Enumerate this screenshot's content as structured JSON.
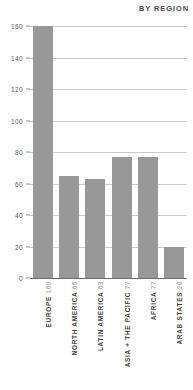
{
  "chart": {
    "title": "BY REGION"
  },
  "chart_data": {
    "type": "bar",
    "title": "BY REGION",
    "xlabel": "",
    "ylabel": "",
    "ylim": [
      0,
      160
    ],
    "yticks": [
      0,
      20,
      40,
      60,
      80,
      100,
      120,
      140,
      160
    ],
    "ytick_labels": [
      "0",
      "20",
      "40",
      "60",
      "80",
      "100",
      "120",
      "140",
      "160"
    ],
    "grid": true,
    "legend": false,
    "orientation": "vertical",
    "bar_color": "#989898",
    "categories": [
      "EUROPE",
      "NORTH AMERICA",
      "LATIN AMERICA",
      "ASIA + THE PACIFIC",
      "AFRICA",
      "ARAB STATES"
    ],
    "values": [
      160,
      65,
      63,
      77,
      77,
      20
    ],
    "value_labels": [
      "160",
      "65",
      "63",
      "77",
      "77",
      "20"
    ],
    "bars": [
      {
        "label": "EUROPE",
        "value": 160,
        "value_text": "160"
      },
      {
        "label": "NORTH AMERICA",
        "value": 65,
        "value_text": "65"
      },
      {
        "label": "LATIN AMERICA",
        "value": 63,
        "value_text": "63"
      },
      {
        "label": "ASIA + THE PACIFIC",
        "value": 77,
        "value_text": "77"
      },
      {
        "label": "AFRICA",
        "value": 77,
        "value_text": "77"
      },
      {
        "label": "ARAB STATES",
        "value": 20,
        "value_text": "20"
      }
    ]
  }
}
